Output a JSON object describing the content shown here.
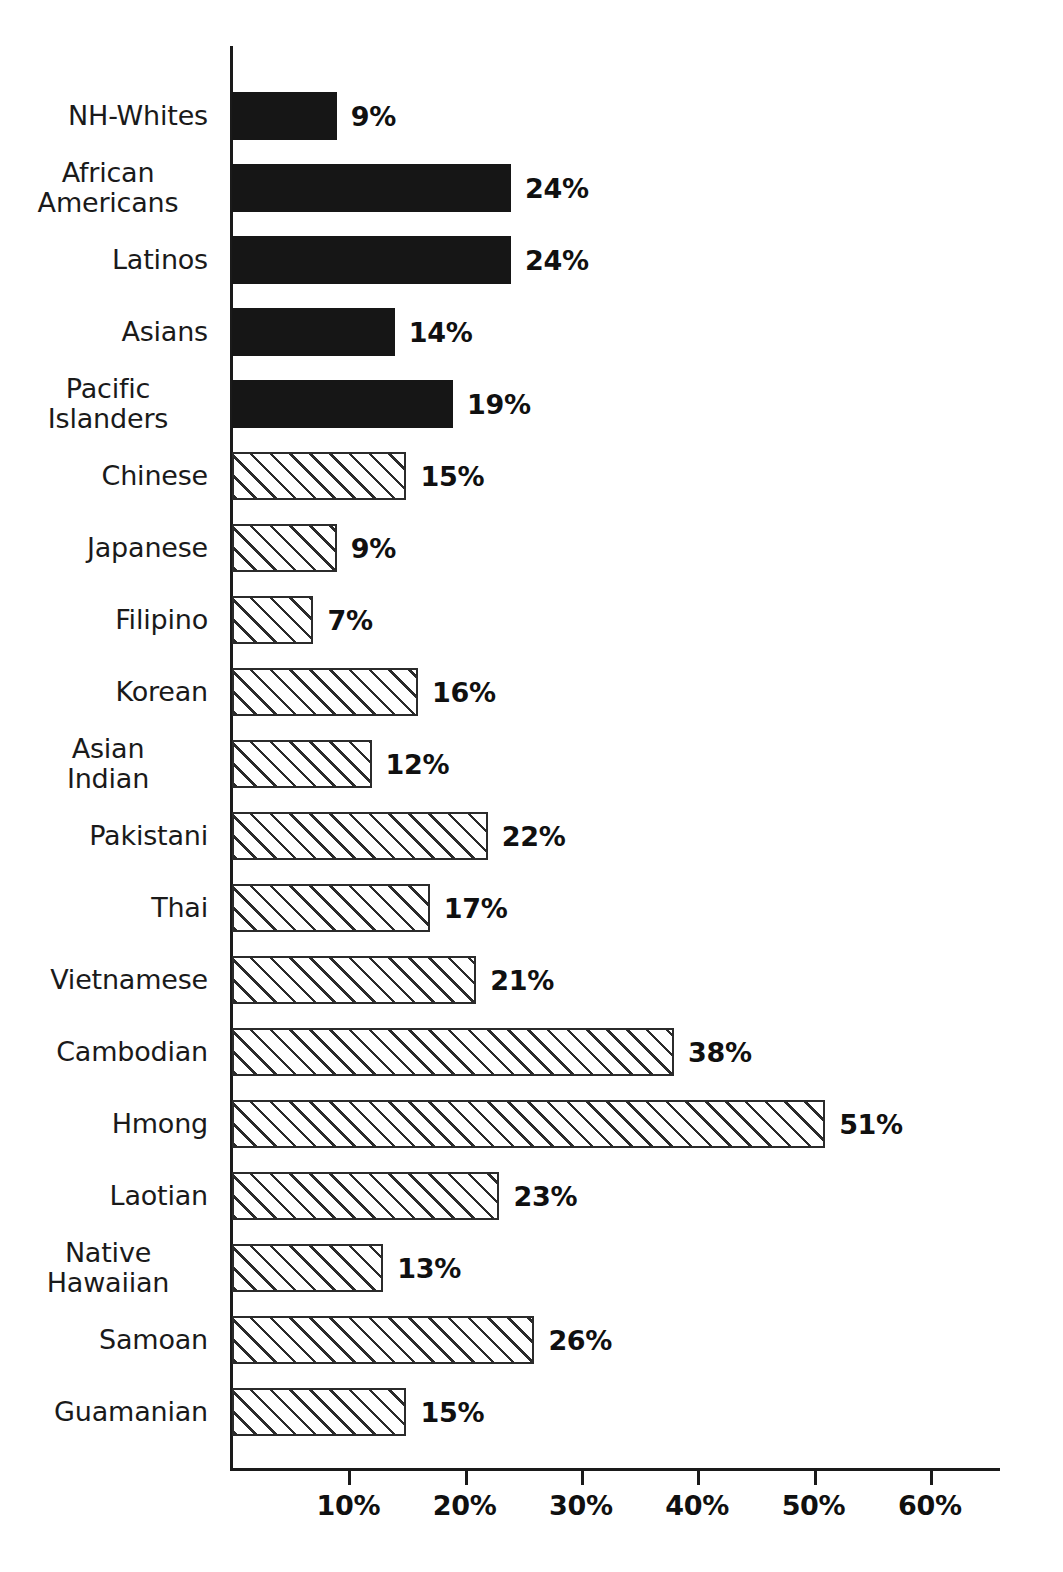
{
  "chart_data": {
    "type": "bar",
    "orientation": "horizontal",
    "title": "",
    "subtitle": "",
    "xlabel": "",
    "ylabel": "",
    "xlim": [
      0,
      66
    ],
    "ylim": null,
    "grid": false,
    "legend": null,
    "axis": {
      "tick_labels": [
        "10%",
        "20%",
        "30%",
        "40%",
        "50%",
        "60%"
      ],
      "tick_values": [
        10,
        20,
        30,
        40,
        50,
        60
      ],
      "units": "percent"
    },
    "categories": [
      "NH-Whites",
      "African Americans",
      "Latinos",
      "Asians",
      "Pacific Islanders",
      "Chinese",
      "Japanese",
      "Filipino",
      "Korean",
      "Asian Indian",
      "Pakistani",
      "Thai",
      "Vietnamese",
      "Cambodian",
      "Hmong",
      "Laotian",
      "Native Hawaiian",
      "Samoan",
      "Guamanian"
    ],
    "values": [
      9,
      24,
      24,
      14,
      19,
      15,
      9,
      7,
      16,
      12,
      22,
      17,
      21,
      38,
      51,
      23,
      13,
      26,
      15
    ],
    "value_labels": [
      "9%",
      "24%",
      "24%",
      "14%",
      "19%",
      "15%",
      "9%",
      "7%",
      "16%",
      "12%",
      "22%",
      "17%",
      "21%",
      "38%",
      "51%",
      "23%",
      "13%",
      "26%",
      "15%"
    ],
    "bar_styles": [
      "solid",
      "solid",
      "solid",
      "solid",
      "solid",
      "hatched",
      "hatched",
      "hatched",
      "hatched",
      "hatched",
      "hatched",
      "hatched",
      "hatched",
      "hatched",
      "hatched",
      "hatched",
      "hatched",
      "hatched",
      "hatched"
    ],
    "colors": {
      "solid_fill": "#161616",
      "hatch_line": "#2b2b2b",
      "hatch_background": "#ffffff",
      "axis": "#1a1a1a",
      "text": "#1a1a1a",
      "page_background": "#ffffff"
    }
  },
  "rows": [
    {
      "label_lines": [
        "NH-Whites"
      ],
      "value": 9,
      "value_label": "9%",
      "style": "solid"
    },
    {
      "label_lines": [
        "African",
        "Americans"
      ],
      "value": 24,
      "value_label": "24%",
      "style": "solid"
    },
    {
      "label_lines": [
        "Latinos"
      ],
      "value": 24,
      "value_label": "24%",
      "style": "solid"
    },
    {
      "label_lines": [
        "Asians"
      ],
      "value": 14,
      "value_label": "14%",
      "style": "solid"
    },
    {
      "label_lines": [
        "Pacific",
        "Islanders"
      ],
      "value": 19,
      "value_label": "19%",
      "style": "solid"
    },
    {
      "label_lines": [
        "Chinese"
      ],
      "value": 15,
      "value_label": "15%",
      "style": "hatched"
    },
    {
      "label_lines": [
        "Japanese"
      ],
      "value": 9,
      "value_label": "9%",
      "style": "hatched"
    },
    {
      "label_lines": [
        "Filipino"
      ],
      "value": 7,
      "value_label": "7%",
      "style": "hatched"
    },
    {
      "label_lines": [
        "Korean"
      ],
      "value": 16,
      "value_label": "16%",
      "style": "hatched"
    },
    {
      "label_lines": [
        "Asian",
        "Indian"
      ],
      "value": 12,
      "value_label": "12%",
      "style": "hatched"
    },
    {
      "label_lines": [
        "Pakistani"
      ],
      "value": 22,
      "value_label": "22%",
      "style": "hatched"
    },
    {
      "label_lines": [
        "Thai"
      ],
      "value": 17,
      "value_label": "17%",
      "style": "hatched"
    },
    {
      "label_lines": [
        "Vietnamese"
      ],
      "value": 21,
      "value_label": "21%",
      "style": "hatched"
    },
    {
      "label_lines": [
        "Cambodian"
      ],
      "value": 38,
      "value_label": "38%",
      "style": "hatched"
    },
    {
      "label_lines": [
        "Hmong"
      ],
      "value": 51,
      "value_label": "51%",
      "style": "hatched"
    },
    {
      "label_lines": [
        "Laotian"
      ],
      "value": 23,
      "value_label": "23%",
      "style": "hatched"
    },
    {
      "label_lines": [
        "Native",
        "Hawaiian"
      ],
      "value": 13,
      "value_label": "13%",
      "style": "hatched"
    },
    {
      "label_lines": [
        "Samoan"
      ],
      "value": 26,
      "value_label": "26%",
      "style": "hatched"
    },
    {
      "label_lines": [
        "Guamanian"
      ],
      "value": 15,
      "value_label": "15%",
      "style": "hatched"
    }
  ],
  "x_ticks": [
    {
      "label": "10%",
      "value": 10
    },
    {
      "label": "20%",
      "value": 20
    },
    {
      "label": "30%",
      "value": 30
    },
    {
      "label": "40%",
      "value": 40
    },
    {
      "label": "50%",
      "value": 50
    },
    {
      "label": "60%",
      "value": 60
    }
  ]
}
